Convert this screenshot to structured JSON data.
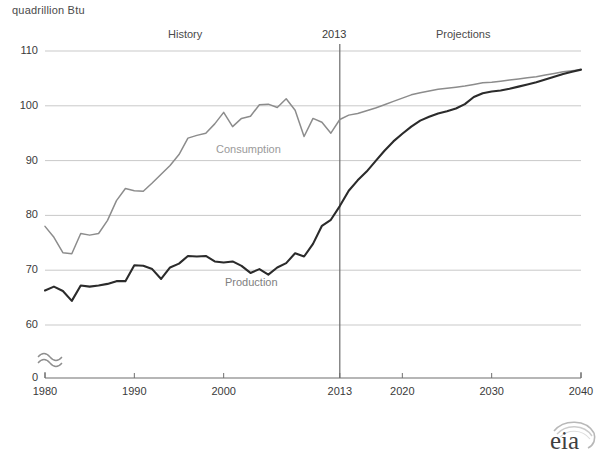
{
  "axis_unit_label": "quadrillion  Btu",
  "annotations": {
    "history": "History",
    "projections": "Projections",
    "divider_year": "2013"
  },
  "series_labels": {
    "consumption": "Consumption",
    "production": "Production"
  },
  "logo": {
    "text": "eia",
    "name": "eia-logo"
  },
  "colors": {
    "consumption": "#8c8c8c",
    "production": "#2b2b2b",
    "gridline": "#c9c9c9",
    "axis": "#6f6f6f",
    "divider": "#6b6b6b",
    "text": "#3a3a3a"
  },
  "chart_data": {
    "type": "line",
    "title": "",
    "subtitle": "",
    "xlabel": "",
    "ylabel": "quadrillion Btu",
    "ylim": [
      60,
      110
    ],
    "y_axis_break": true,
    "y_break_base": 0,
    "grid": true,
    "legend": "inline-labels",
    "xlim": [
      1980,
      2040
    ],
    "yticks": [
      0,
      60,
      70,
      80,
      90,
      100,
      110
    ],
    "xticks": [
      1980,
      1990,
      2000,
      2013,
      2020,
      2030,
      2040
    ],
    "divider_x": 2013,
    "x": [
      1980,
      1981,
      1982,
      1983,
      1984,
      1985,
      1986,
      1987,
      1988,
      1989,
      1990,
      1991,
      1992,
      1993,
      1994,
      1995,
      1996,
      1997,
      1998,
      1999,
      2000,
      2001,
      2002,
      2003,
      2004,
      2005,
      2006,
      2007,
      2008,
      2009,
      2010,
      2011,
      2012,
      2013,
      2014,
      2015,
      2016,
      2017,
      2018,
      2019,
      2020,
      2021,
      2022,
      2023,
      2024,
      2025,
      2026,
      2027,
      2028,
      2029,
      2030,
      2031,
      2032,
      2033,
      2034,
      2035,
      2036,
      2037,
      2038,
      2039,
      2040
    ],
    "series": [
      {
        "name": "Consumption",
        "color": "#8c8c8c",
        "values": [
          78.0,
          76.0,
          73.2,
          73.0,
          76.7,
          76.4,
          76.7,
          79.1,
          82.7,
          84.9,
          84.5,
          84.4,
          85.9,
          87.5,
          89.1,
          91.1,
          94.1,
          94.6,
          95.0,
          96.7,
          98.8,
          96.2,
          97.7,
          98.1,
          100.2,
          100.3,
          99.7,
          101.3,
          99.2,
          94.4,
          97.7,
          97.0,
          95.0,
          97.5,
          98.3,
          98.6,
          99.1,
          99.6,
          100.2,
          100.8,
          101.4,
          102.0,
          102.4,
          102.7,
          103.0,
          103.2,
          103.4,
          103.6,
          103.9,
          104.2,
          104.3,
          104.5,
          104.7,
          104.9,
          105.1,
          105.3,
          105.6,
          105.9,
          106.2,
          106.4,
          106.6
        ]
      },
      {
        "name": "Production",
        "color": "#2b2b2b",
        "values": [
          66.3,
          67.0,
          66.2,
          64.4,
          67.2,
          67.0,
          67.2,
          67.5,
          68.0,
          68.0,
          70.9,
          70.8,
          70.2,
          68.4,
          70.5,
          71.2,
          72.6,
          72.5,
          72.6,
          71.6,
          71.4,
          71.6,
          70.8,
          69.5,
          70.2,
          69.2,
          70.5,
          71.3,
          73.1,
          72.5,
          74.8,
          78.1,
          79.2,
          81.7,
          84.5,
          86.4,
          88.0,
          89.9,
          91.8,
          93.5,
          94.9,
          96.2,
          97.3,
          98.0,
          98.6,
          99.0,
          99.5,
          100.3,
          101.6,
          102.3,
          102.6,
          102.8,
          103.1,
          103.5,
          103.9,
          104.3,
          104.8,
          105.3,
          105.8,
          106.2,
          106.6
        ]
      }
    ]
  }
}
